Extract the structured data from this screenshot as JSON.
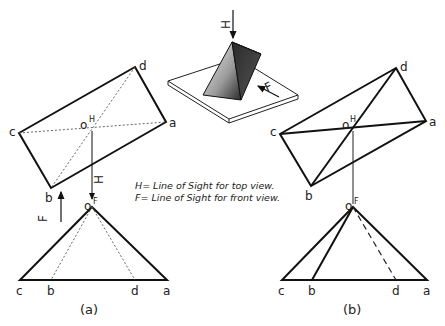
{
  "legend": {
    "line1": "H= Line of Sight for top view.",
    "line2": "F= Line of Sight for front view."
  },
  "pictorial": {
    "h_arrow_label": "H",
    "f_arrow_label": "F"
  },
  "view_a": {
    "caption": "(a)",
    "top": {
      "labels": {
        "a": "a",
        "b": "b",
        "c": "c",
        "d": "d",
        "o": "o",
        "o_sup": "H"
      },
      "points": {
        "a": [
          166,
          122
        ],
        "b": [
          51,
          188
        ],
        "c": [
          19,
          133
        ],
        "d": [
          135,
          67
        ],
        "o": [
          92,
          127
        ]
      }
    },
    "front": {
      "labels": {
        "a": "a",
        "b": "b",
        "c": "c",
        "d": "d",
        "o": "o",
        "o_sup": "F"
      },
      "points": {
        "a": [
          167,
          280
        ],
        "b": [
          51,
          280
        ],
        "c": [
          20,
          280
        ],
        "d": [
          135,
          280
        ],
        "o": [
          92,
          207
        ]
      }
    },
    "h_arrow_label": "H",
    "f_arrow_label": "F"
  },
  "view_b": {
    "caption": "(b)",
    "top": {
      "labels": {
        "a": "a",
        "b": "b",
        "c": "c",
        "d": "d",
        "o": "o",
        "o_sup": "H"
      },
      "points": {
        "a": [
          426,
          121
        ],
        "b": [
          311,
          186
        ],
        "c": [
          280,
          134
        ],
        "d": [
          396,
          68
        ],
        "o": [
          353,
          127
        ]
      }
    },
    "front": {
      "labels": {
        "a": "a",
        "b": "b",
        "c": "c",
        "d": "d",
        "o": "o",
        "o_sup": "F"
      },
      "points": {
        "a": [
          427,
          280
        ],
        "b": [
          312,
          280
        ],
        "c": [
          282,
          280
        ],
        "d": [
          396,
          280
        ],
        "o": [
          353,
          207
        ]
      }
    }
  },
  "colors": {
    "line": "#111111",
    "background": "#ffffff"
  }
}
